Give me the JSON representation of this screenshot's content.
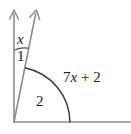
{
  "figure": {
    "type": "geometry-angle-diagram",
    "stroke_color": "#8c8c8c",
    "text_color": "#1a1a1a",
    "background_color": "#ffffff",
    "width": 131,
    "height": 134
  },
  "labels": {
    "angle_x": "x",
    "angle_1": "1",
    "angle_2": "2",
    "expression": "7x + 2"
  },
  "expression_parts": {
    "coefficient": "7",
    "variable": "x",
    "operator": "+",
    "constant": "2"
  },
  "geometry": {
    "vertex": {
      "x": 14,
      "y": 122
    },
    "ray_vertical": {
      "tip_x": 14,
      "tip_y": 11,
      "arrowhead": true
    },
    "ray_slanted": {
      "tip_x": 36,
      "tip_y": 11,
      "arrowhead": true
    },
    "ray_horizontal": {
      "end_x": 129,
      "end_y": 122,
      "arrowhead": false
    },
    "small_arc_angle_x": {
      "from_x": 15,
      "from_y": 50,
      "to_x": 27,
      "to_y": 48
    },
    "large_arc_angle_2": {
      "from_x": 28,
      "from_y": 66,
      "to_x": 70,
      "to_y": 122
    }
  }
}
